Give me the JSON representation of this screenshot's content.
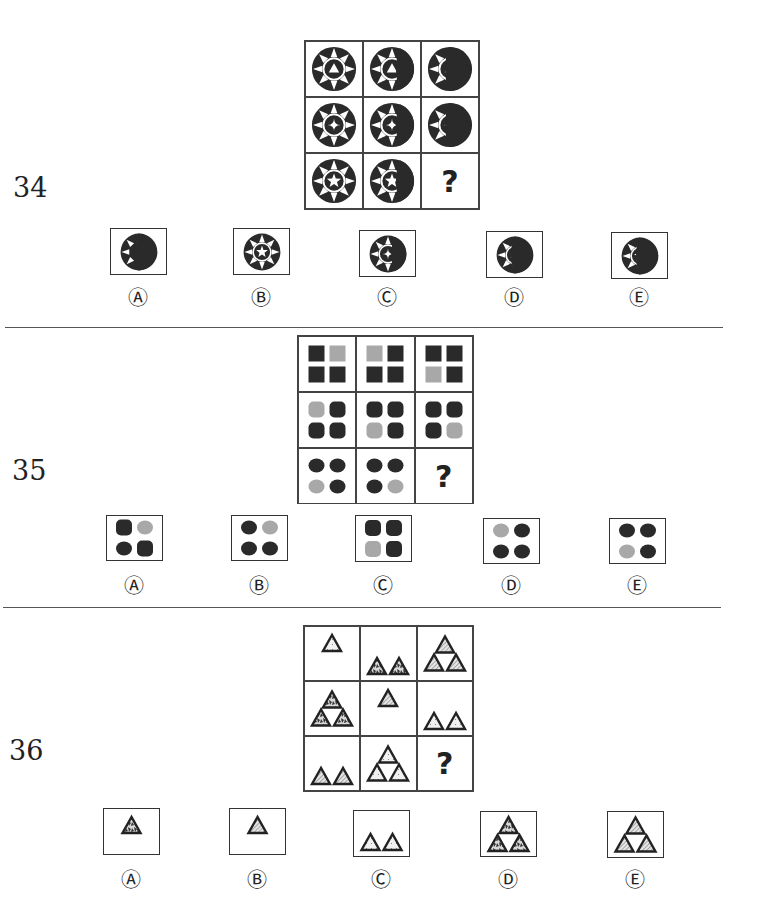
{
  "questions": [
    {
      "number": "34",
      "grid": {
        "rows": [
          [
            {
              "type": "emblem",
              "center": "triangle",
              "mask": 0
            },
            {
              "type": "emblem",
              "center": "triangle",
              "mask": 1
            },
            {
              "type": "emblem",
              "center": "triangle",
              "mask": 2
            }
          ],
          [
            {
              "type": "emblem",
              "center": "diamond",
              "mask": 0
            },
            {
              "type": "emblem",
              "center": "diamond",
              "mask": 1
            },
            {
              "type": "emblem",
              "center": "diamond",
              "mask": 2
            }
          ],
          [
            {
              "type": "emblem",
              "center": "star",
              "mask": 0
            },
            {
              "type": "emblem",
              "center": "star",
              "mask": 1
            },
            {
              "type": "missing",
              "label": "?"
            }
          ]
        ]
      },
      "options": [
        {
          "letter": "A",
          "label": "Ⓐ",
          "figure": {
            "center": "none",
            "mask": 2
          }
        },
        {
          "letter": "B",
          "label": "Ⓑ",
          "figure": {
            "center": "star",
            "mask": 0
          }
        },
        {
          "letter": "C",
          "label": "Ⓒ",
          "figure": {
            "center": "diamond",
            "mask": 1
          }
        },
        {
          "letter": "D",
          "label": "Ⓓ",
          "figure": {
            "center": "triangle",
            "mask": 2
          }
        },
        {
          "letter": "E",
          "label": "Ⓔ",
          "figure": {
            "center": "star",
            "mask": 2
          }
        }
      ]
    },
    {
      "number": "35",
      "grid": {
        "rows": [
          [
            {
              "shape": "square",
              "gray": 1
            },
            {
              "shape": "square",
              "gray": 0
            },
            {
              "shape": "square",
              "gray": 2
            }
          ],
          [
            {
              "shape": "rounded",
              "gray": 0
            },
            {
              "shape": "rounded",
              "gray": 2
            },
            {
              "shape": "rounded",
              "gray": 3
            }
          ],
          [
            {
              "shape": "circle",
              "gray": 2
            },
            {
              "shape": "circle",
              "gray": 3
            },
            {
              "type": "missing",
              "label": "?"
            }
          ]
        ]
      },
      "options": [
        {
          "letter": "A",
          "label": "Ⓐ",
          "figure": {
            "shape": "mixed",
            "gray": 1
          }
        },
        {
          "letter": "B",
          "label": "Ⓑ",
          "figure": {
            "shape": "circle",
            "gray": 1
          }
        },
        {
          "letter": "C",
          "label": "Ⓒ",
          "figure": {
            "shape": "rounded",
            "gray": 2
          }
        },
        {
          "letter": "D",
          "label": "Ⓓ",
          "figure": {
            "shape": "circle",
            "gray": 0
          }
        },
        {
          "letter": "E",
          "label": "Ⓔ",
          "figure": {
            "shape": "circle",
            "gray": 2
          }
        }
      ]
    },
    {
      "number": "36",
      "grid": {
        "rows": [
          [
            {
              "count": 1,
              "fill": "dots",
              "pos": "top"
            },
            {
              "count": 2,
              "fill": "mottled",
              "pos": "bottom"
            },
            {
              "count": 3,
              "fill": "hatch",
              "pos": "center"
            }
          ],
          [
            {
              "count": 3,
              "fill": "mottled",
              "pos": "center"
            },
            {
              "count": 1,
              "fill": "hatch",
              "pos": "top"
            },
            {
              "count": 2,
              "fill": "dots",
              "pos": "bottom"
            }
          ],
          [
            {
              "count": 2,
              "fill": "hatch",
              "pos": "bottom"
            },
            {
              "count": 3,
              "fill": "dots",
              "pos": "center"
            },
            {
              "type": "missing",
              "label": "?"
            }
          ]
        ]
      },
      "options": [
        {
          "letter": "A",
          "label": "Ⓐ",
          "figure": {
            "count": 1,
            "fill": "mottled",
            "pos": "top"
          }
        },
        {
          "letter": "B",
          "label": "Ⓑ",
          "figure": {
            "count": 1,
            "fill": "hatch",
            "pos": "top"
          }
        },
        {
          "letter": "C",
          "label": "Ⓒ",
          "figure": {
            "count": 2,
            "fill": "dots",
            "pos": "bottom"
          }
        },
        {
          "letter": "D",
          "label": "Ⓓ",
          "figure": {
            "count": 3,
            "fill": "mottled",
            "pos": "center"
          }
        },
        {
          "letter": "E",
          "label": "Ⓔ",
          "figure": {
            "count": 3,
            "fill": "hatch",
            "pos": "center"
          }
        }
      ]
    }
  ],
  "colors": {
    "ink": "#222222",
    "gray_fill": "#a8a8a8",
    "dark_fill": "#2a2a2a",
    "border": "#444444"
  }
}
